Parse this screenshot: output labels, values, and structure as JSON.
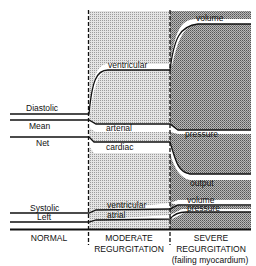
{
  "diagram": {
    "columns": [
      {
        "id": "normal",
        "label_lines": [
          "NORMAL"
        ]
      },
      {
        "id": "moderate",
        "label_lines": [
          "MODERATE",
          "REGURGITATION"
        ]
      },
      {
        "id": "severe",
        "label_lines": [
          "SEVERE",
          "REGURGITATION",
          "(failing myocardium)"
        ]
      }
    ],
    "left_labels": {
      "diastolic": "Diastolic",
      "mean": "Mean",
      "net": "Net",
      "systolic": "Systolic",
      "left": "Left"
    },
    "curve_labels": {
      "ventricular_top": "ventricular",
      "volume_top": "volume",
      "arterial": "arterial",
      "pressure_mid": "pressure",
      "cardiac": "cardiac",
      "output": "output",
      "ventricular_bottom": "ventricular",
      "atrial": "atrial",
      "volume_bottom": "volume",
      "pressure_bottom": "pressure"
    },
    "colors": {
      "line": "#111111",
      "moderate_shade": "#c9c9c9",
      "severe_shade": "#9a9a9a"
    }
  }
}
